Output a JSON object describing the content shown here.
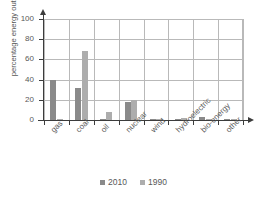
{
  "chart_data": {
    "type": "bar",
    "title": "",
    "xlabel": "",
    "ylabel": "percentage energy output, %",
    "categories": [
      "gas",
      "coal",
      "oil",
      "nuclear",
      "wind",
      "hydroelectric",
      "bio-energy",
      "other"
    ],
    "series": [
      {
        "name": "2010",
        "color": "#8a8a8a",
        "values": [
          40,
          32,
          0.5,
          18,
          1.5,
          0.8,
          2.5,
          1
        ]
      },
      {
        "name": "1990",
        "color": "#adadad",
        "values": [
          0.8,
          68,
          8,
          19.5,
          0.2,
          2,
          0.3,
          1
        ]
      }
    ],
    "ylim": [
      0,
      100
    ],
    "yticks": [
      "0",
      "20",
      "40",
      "60",
      "80",
      "100"
    ],
    "ytick_values": [
      0,
      20,
      40,
      60,
      80,
      100
    ],
    "grid": "both",
    "legend_position": "bottom"
  },
  "legend": {
    "items": [
      {
        "label": "2010"
      },
      {
        "label": "1990"
      }
    ]
  },
  "icons": {
    "y_axis_arrow": "arrow-up-icon",
    "x_axis_arrow": "arrow-right-icon"
  }
}
